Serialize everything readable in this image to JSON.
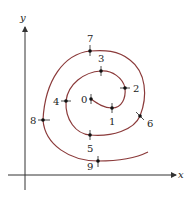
{
  "diagram": {
    "type": "spiral-curve",
    "axes": {
      "x_label": "x",
      "y_label": "y"
    },
    "curve_color": "#8b3a3a",
    "points": [
      {
        "label": "0",
        "x": 91,
        "y": 99
      },
      {
        "label": "1",
        "x": 112,
        "y": 108
      },
      {
        "label": "2",
        "x": 125,
        "y": 88
      },
      {
        "label": "3",
        "x": 101,
        "y": 71
      },
      {
        "label": "4",
        "x": 66,
        "y": 101
      },
      {
        "label": "5",
        "x": 90,
        "y": 135
      },
      {
        "label": "6",
        "x": 140,
        "y": 116
      },
      {
        "label": "7",
        "x": 90,
        "y": 51
      },
      {
        "label": "8",
        "x": 43,
        "y": 120
      },
      {
        "label": "9",
        "x": 98,
        "y": 161
      }
    ]
  }
}
